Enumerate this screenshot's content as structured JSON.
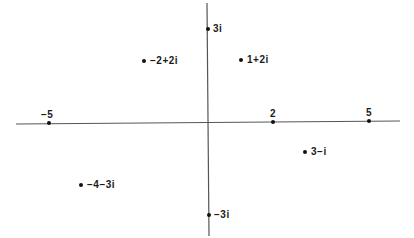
{
  "diagram": {
    "title": "",
    "type": "complex-plane",
    "colors": {
      "background": "#ffffff",
      "axis": "#555555",
      "point": "#111111",
      "text": "#1a1a1a"
    },
    "axes": {
      "real": {
        "x1": 16,
        "y1": 124,
        "x2": 400,
        "y2": 121
      },
      "imaginary": {
        "x1": 207,
        "y1": 3,
        "x2": 209,
        "y2": 236
      }
    },
    "tick_labels": [
      {
        "id": "neg5",
        "text": "−5",
        "dot_x": 49,
        "dot_y": 123,
        "label_x": 41,
        "label_y": 110
      },
      {
        "id": "pos2",
        "text": "2",
        "dot_x": 273,
        "dot_y": 122,
        "label_x": 270,
        "label_y": 109
      },
      {
        "id": "pos5",
        "text": "5",
        "dot_x": 369,
        "dot_y": 121,
        "label_x": 366,
        "label_y": 108
      }
    ],
    "points": [
      {
        "id": "p-3i",
        "text": "3i",
        "dot_x": 208,
        "dot_y": 29,
        "label_x": 213,
        "label_y": 24
      },
      {
        "id": "p-neg2-plus-2i",
        "text": "−2+2i",
        "dot_x": 144,
        "dot_y": 61,
        "label_x": 150,
        "label_y": 56
      },
      {
        "id": "p-1-plus-2i",
        "text": "1+2i",
        "dot_x": 241,
        "dot_y": 60,
        "label_x": 247,
        "label_y": 55
      },
      {
        "id": "p-3-minus-i",
        "text": "3−i",
        "dot_x": 305,
        "dot_y": 152,
        "label_x": 311,
        "label_y": 147
      },
      {
        "id": "p-neg4-minus-3i",
        "text": "−4−3i",
        "dot_x": 81,
        "dot_y": 185,
        "label_x": 87,
        "label_y": 180
      },
      {
        "id": "p-neg3i",
        "text": "−3i",
        "dot_x": 209,
        "dot_y": 215,
        "label_x": 214,
        "label_y": 210
      }
    ]
  }
}
